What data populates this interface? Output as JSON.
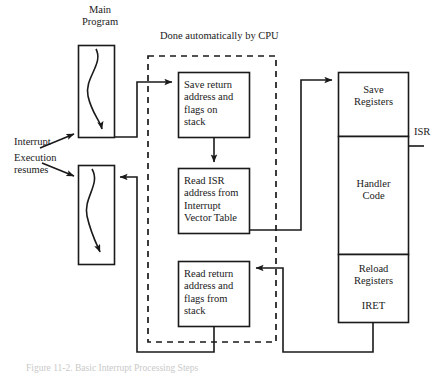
{
  "figure": {
    "caption": "Figure 11-2.  Basic Interrupt Processing Steps"
  },
  "labels": {
    "main_program": "Main\nProgram",
    "done_by_cpu": "Done automatically by CPU",
    "interrupt": "Interrupt",
    "execution_resumes": "Execution\nresumes",
    "isr": "ISR"
  },
  "cpu_steps": [
    {
      "id": "save-return-address",
      "text": "Save return\naddress and\nflags on\nstack"
    },
    {
      "id": "read-isr-address",
      "text": "Read ISR\naddress from\nInterrupt\nVector Table"
    },
    {
      "id": "read-return-address",
      "text": "Read return\naddress and\nflags from\nstack"
    }
  ],
  "isr_steps": [
    {
      "id": "save-registers",
      "text": "Save\nRegisters"
    },
    {
      "id": "handler-code",
      "text": "Handler\nCode"
    },
    {
      "id": "reload-registers",
      "text": "Reload\nRegisters"
    },
    {
      "id": "iret",
      "text": "IRET"
    }
  ],
  "colors": {
    "line": "#1a1a1a",
    "background": "#ffffff",
    "text": "#1a1a1a"
  }
}
